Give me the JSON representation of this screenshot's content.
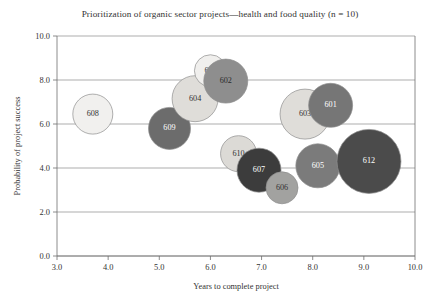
{
  "chart_data": {
    "type": "scatter",
    "title": "Prioritization of organic sector projects—health and food quality (n = 10)",
    "xlabel": "Years to complete project",
    "ylabel": "Probability of project success",
    "xlim": [
      3.0,
      10.0
    ],
    "ylim": [
      0.0,
      10.0
    ],
    "xticks": [
      "3.0",
      "4.0",
      "5.0",
      "6.0",
      "7.0",
      "8.0",
      "9.0",
      "10.0"
    ],
    "yticks": [
      "0.0",
      "2.0",
      "4.0",
      "6.0",
      "8.0",
      "10.0"
    ],
    "grid": "horizontal",
    "legend": "none",
    "bubble_size_encodes": "project budget (relative bubble area)",
    "points": [
      {
        "label": "608",
        "x": 3.7,
        "y": 6.45,
        "r_px": 20,
        "fill": "#f1f0ee",
        "text_color": "#333333"
      },
      {
        "label": "609",
        "x": 5.2,
        "y": 5.8,
        "r_px": 21,
        "fill": "#6c6c6c",
        "text_color": "#ffffff"
      },
      {
        "label": "604",
        "x": 5.7,
        "y": 7.15,
        "r_px": 23,
        "fill": "#dfddd9",
        "text_color": "#333333"
      },
      {
        "label": "611",
        "x": 6.0,
        "y": 8.42,
        "r_px": 16,
        "fill": "#f0efed",
        "text_color": "#333333"
      },
      {
        "label": "602",
        "x": 6.3,
        "y": 7.95,
        "r_px": 22,
        "fill": "#8e8e8e",
        "text_color": "#2b2b2b"
      },
      {
        "label": "610",
        "x": 6.55,
        "y": 4.65,
        "r_px": 18,
        "fill": "#dcdad6",
        "text_color": "#333333"
      },
      {
        "label": "607",
        "x": 6.95,
        "y": 3.9,
        "r_px": 22,
        "fill": "#3c3c3c",
        "text_color": "#ffffff"
      },
      {
        "label": "606",
        "x": 7.4,
        "y": 3.1,
        "r_px": 16,
        "fill": "#a2a2a0",
        "text_color": "#333333"
      },
      {
        "label": "603",
        "x": 7.85,
        "y": 6.45,
        "r_px": 25,
        "fill": "#dfddd9",
        "text_color": "#333333"
      },
      {
        "label": "601",
        "x": 8.35,
        "y": 6.85,
        "r_px": 22,
        "fill": "#767676",
        "text_color": "#ffffff"
      },
      {
        "label": "605",
        "x": 8.1,
        "y": 4.1,
        "r_px": 22,
        "fill": "#7b7b7b",
        "text_color": "#ffffff"
      },
      {
        "label": "612",
        "x": 9.1,
        "y": 4.3,
        "r_px": 32,
        "fill": "#4b4b4b",
        "text_color": "#ffffff"
      }
    ]
  }
}
